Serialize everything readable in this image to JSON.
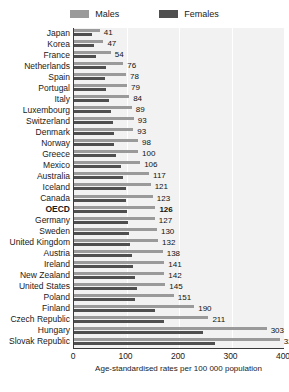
{
  "legend": {
    "items": [
      {
        "label": "Males",
        "color": "#9a9a9a",
        "name": "legend-swatch-males"
      },
      {
        "label": "Females",
        "color": "#4f4f4f",
        "name": "legend-swatch-females"
      }
    ]
  },
  "axis": {
    "caption": "Age-standardised rates per 100 000 population",
    "ticks": [
      "0",
      "100",
      "200",
      "300",
      "400"
    ]
  },
  "chart_data": {
    "type": "bar",
    "title": "",
    "subtitle": "",
    "xlabel": "Age-standardised rates per 100 000 population",
    "ylabel": "",
    "xlim": [
      0,
      400
    ],
    "xticks": [
      0,
      100,
      200,
      300,
      400
    ],
    "grid": true,
    "orientation": "horizontal",
    "legend_position": "top-center",
    "legend": [
      "Males",
      "Females"
    ],
    "categories": [
      "Japan",
      "Korea",
      "France",
      "Netherlands",
      "Spain",
      "Portugal",
      "Italy",
      "Luxembourg",
      "Switzerland",
      "Denmark",
      "Norway",
      "Greece",
      "Mexico",
      "Australia",
      "Iceland",
      "Canada",
      "OECD",
      "Germany",
      "Sweden",
      "United Kingdom",
      "Austria",
      "Ireland",
      "New Zealand",
      "United States",
      "Poland",
      "Finland",
      "Czech Republic",
      "Hungary",
      "Slovak Republic"
    ],
    "highlighted_category": "OECD",
    "value_labels": [
      41,
      47,
      54,
      76,
      78,
      79,
      84,
      89,
      93,
      93,
      98,
      100,
      106,
      117,
      121,
      123,
      126,
      127,
      130,
      132,
      138,
      141,
      142,
      145,
      151,
      190,
      211,
      303,
      324
    ],
    "series": [
      {
        "name": "Males",
        "color": "#9a9a9a",
        "values": [
          49,
          56,
          70,
          94,
          99,
          101,
          105,
          110,
          114,
          113,
          122,
          122,
          126,
          143,
          146,
          150,
          155,
          154,
          158,
          160,
          169,
          172,
          172,
          174,
          190,
          229,
          256,
          367,
          392
        ]
      },
      {
        "name": "Females",
        "color": "#4f4f4f",
        "values": [
          34,
          39,
          41,
          60,
          59,
          60,
          66,
          70,
          75,
          76,
          77,
          80,
          89,
          94,
          99,
          99,
          100,
          103,
          105,
          107,
          110,
          113,
          116,
          120,
          117,
          155,
          172,
          246,
          268
        ]
      }
    ]
  }
}
